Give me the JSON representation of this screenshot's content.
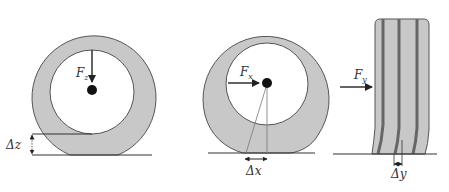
{
  "diagram": {
    "colors": {
      "tire_fill": "#c8c8c8",
      "outline": "#444444",
      "groove": "#666666",
      "hub": "#111111",
      "ground": "#333333",
      "background": "#ffffff"
    },
    "panels": [
      {
        "id": "vertical",
        "force_label": "F",
        "force_subscript": "z",
        "force_direction": "down",
        "deflection_label": "Δz"
      },
      {
        "id": "longitudinal",
        "force_label": "F",
        "force_subscript": "x",
        "force_direction": "right",
        "deflection_label": "Δx"
      },
      {
        "id": "lateral",
        "force_label": "F",
        "force_subscript": "y",
        "force_direction": "right",
        "deflection_label": "Δy"
      }
    ]
  }
}
